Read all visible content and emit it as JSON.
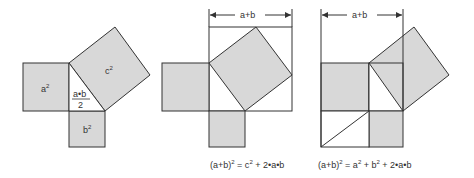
{
  "colors": {
    "fill": "#d8d8d8",
    "stroke": "#333333",
    "background": "#ffffff"
  },
  "figure1": {
    "label_a_sq": "a",
    "label_b_sq": "b",
    "label_c_sq": "c",
    "exponent": "2",
    "triangle_numerator": "a•b",
    "triangle_denominator": "2"
  },
  "figure2": {
    "dimension_label": "a+b",
    "equation_lhs": "(a+b)",
    "equation_exp": "2",
    "equation_rhs_part1": " = c",
    "equation_rhs_exp": "2",
    "equation_rhs_part2": " + 2•a•b"
  },
  "figure3": {
    "dimension_label": "a+b",
    "equation_lhs": "(a+b)",
    "equation_exp": "2",
    "equation_rhs_part1": " = a",
    "equation_rhs_exp1": "2",
    "equation_rhs_part2": " + b",
    "equation_rhs_exp2": "2",
    "equation_rhs_part3": " + 2•a•b"
  }
}
